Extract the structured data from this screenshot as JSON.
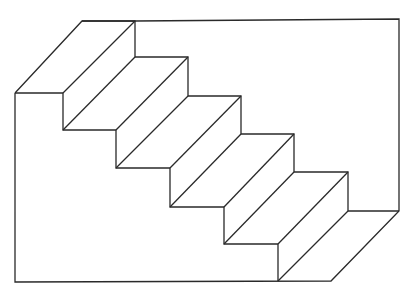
{
  "diagram": {
    "title": "",
    "type": "line-drawing",
    "stroke_color": "#2a2a2a",
    "background": "#ffffff",
    "steps": 5,
    "outline": [
      [
        15,
        93
      ],
      [
        15,
        282
      ],
      [
        331,
        281
      ],
      [
        399,
        211
      ],
      [
        399,
        19
      ],
      [
        135,
        21
      ],
      [
        82,
        21
      ],
      [
        15,
        93
      ]
    ],
    "front_profile": [
      [
        15,
        93
      ],
      [
        63,
        93
      ],
      [
        63,
        130
      ],
      [
        116,
        130
      ],
      [
        116,
        168
      ],
      [
        170,
        168
      ],
      [
        170,
        207
      ],
      [
        224,
        207
      ],
      [
        224,
        244
      ],
      [
        278,
        244
      ],
      [
        278,
        281
      ]
    ],
    "back_profile": [
      [
        82,
        21
      ],
      [
        135,
        21
      ],
      [
        135,
        57
      ],
      [
        188,
        57
      ],
      [
        188,
        96
      ],
      [
        241,
        96
      ],
      [
        241,
        134
      ],
      [
        294,
        134
      ],
      [
        294,
        172
      ],
      [
        348,
        172
      ],
      [
        348,
        211
      ],
      [
        399,
        211
      ]
    ],
    "tread_diagonals": [
      [
        [
          63,
          93
        ],
        [
          135,
          21
        ]
      ],
      [
        [
          63,
          130
        ],
        [
          135,
          57
        ]
      ],
      [
        [
          116,
          130
        ],
        [
          188,
          57
        ]
      ],
      [
        [
          116,
          168
        ],
        [
          188,
          96
        ]
      ],
      [
        [
          170,
          168
        ],
        [
          241,
          96
        ]
      ],
      [
        [
          170,
          207
        ],
        [
          241,
          134
        ]
      ],
      [
        [
          224,
          207
        ],
        [
          294,
          134
        ]
      ],
      [
        [
          224,
          244
        ],
        [
          294,
          172
        ]
      ],
      [
        [
          278,
          244
        ],
        [
          348,
          172
        ]
      ],
      [
        [
          278,
          281
        ],
        [
          348,
          211
        ]
      ]
    ]
  }
}
